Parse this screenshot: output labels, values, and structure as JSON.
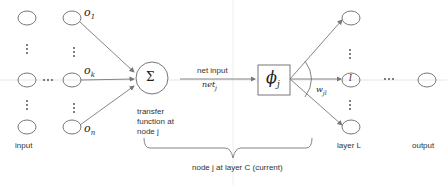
{
  "labels": {
    "input": "input",
    "transfer": [
      "transfer",
      "function at",
      "node j"
    ],
    "net_input": "net input",
    "net_j": "net",
    "net_j_sub": "j",
    "phi": "ϕ",
    "phi_sub": "j",
    "sigma": "Σ",
    "weight": "w",
    "weight_sub": "jl",
    "node_l": "l",
    "layer_l": "layer L",
    "output": "output",
    "brace_caption": "node j at layer C (current)"
  },
  "input_weights": [
    {
      "name": "o",
      "sub": "1"
    },
    {
      "name": "o",
      "sub": "k"
    },
    {
      "name": "o",
      "sub": "n"
    }
  ],
  "ellipsis": "···",
  "colors": {
    "line": "#666666",
    "node": "#777777",
    "text": "#333333",
    "guide": "#dddddd"
  }
}
